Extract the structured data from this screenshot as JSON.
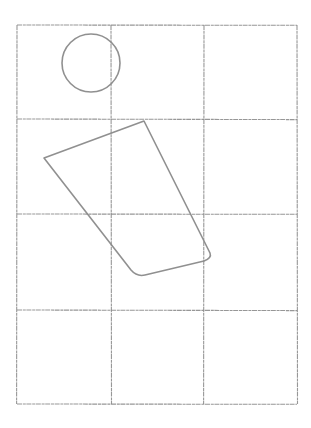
{
  "canvas": {
    "width": 311,
    "height": 428,
    "background": "#ffffff",
    "stroke_color": "#8a8a8a",
    "grid_color": "#8c8c8c"
  },
  "grid": {
    "columns": 3,
    "rows": 4,
    "x_lines": [
      17,
      111,
      204,
      297
    ],
    "y_lines": [
      25,
      119,
      214,
      310,
      404
    ]
  },
  "shapes": {
    "circle": {
      "cx": 91,
      "cy": 63,
      "r": 29
    },
    "quadrilateral": {
      "points": [
        [
          144,
          121
        ],
        [
          44,
          158
        ],
        [
          131,
          270
        ],
        [
          210,
          255
        ]
      ],
      "path": "M144,121 L44,158 L131,270 Q137,277 145,275 L204,261 Q212,258 210,253 Z"
    }
  }
}
